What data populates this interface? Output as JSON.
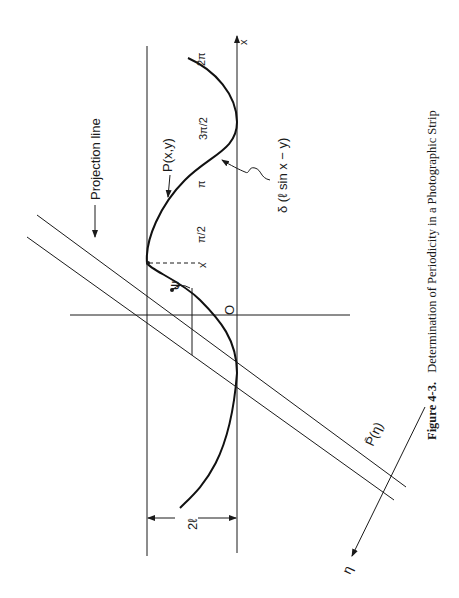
{
  "figure": {
    "caption_number": "Figure 4-3.",
    "caption_text": "Determination of Periodicity in a Photographic Strip",
    "labels": {
      "projection_line": "Projection line",
      "point": "P(x,y)",
      "delta": "δ (ℓ sin x − y)",
      "x_axis": "x",
      "x_marker": "x",
      "origin": "O",
      "psi": "ψ",
      "width": "2ℓ",
      "projection": "P̄(η)",
      "eta": "η",
      "tick_2pi": "2π",
      "tick_3pi_2": "3π/2",
      "tick_pi": "π",
      "tick_pi_2": "π/2"
    },
    "colors": {
      "ink": "#1a1a1a",
      "background": "#ffffff"
    }
  }
}
